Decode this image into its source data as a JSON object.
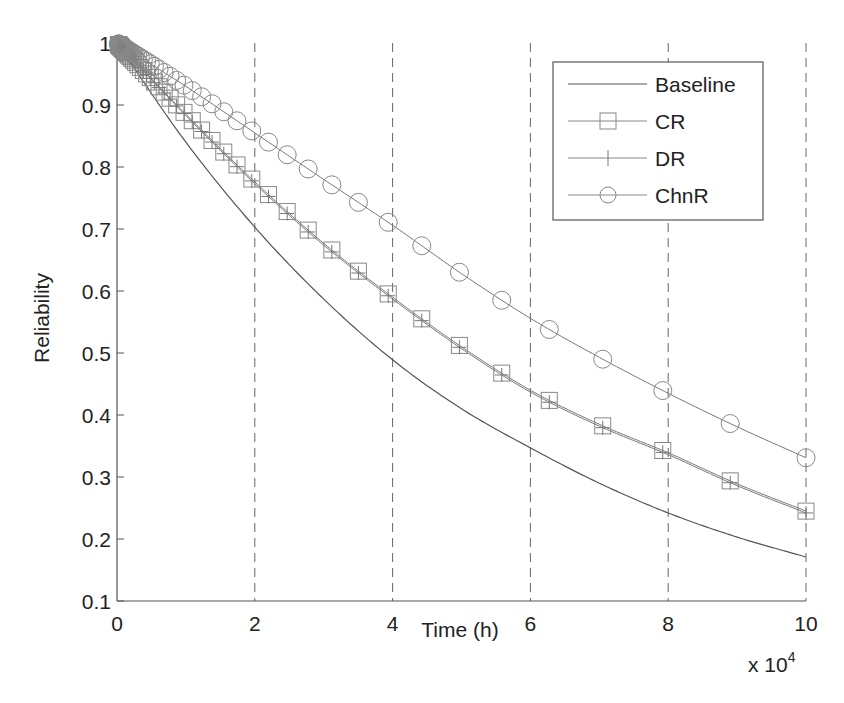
{
  "chart_data": {
    "type": "line",
    "title": "",
    "xlabel": "Time (h)",
    "ylabel": "Reliability",
    "x_multiplier_label": "x 10",
    "x_multiplier_exponent": "4",
    "xlim": [
      0,
      10
    ],
    "ylim": [
      0.1,
      1
    ],
    "xticks": [
      0,
      2,
      4,
      6,
      8,
      10
    ],
    "xtick_labels": [
      "0",
      "2",
      "4",
      "6",
      "8",
      "10"
    ],
    "yticks": [
      0.1,
      0.2,
      0.3,
      0.4,
      0.5,
      0.6,
      0.7,
      0.8,
      0.9,
      1
    ],
    "ytick_labels": [
      "0.1",
      "0.2",
      "0.3",
      "0.4",
      "0.5",
      "0.6",
      "0.7",
      "0.8",
      "0.9",
      "1"
    ],
    "grid": {
      "x": true,
      "y": false,
      "style": "dashed"
    },
    "legend_position": "upper right",
    "x": [
      0,
      1,
      2,
      3,
      4,
      5,
      6,
      7,
      8,
      9,
      10
    ],
    "series": [
      {
        "name": "Baseline",
        "marker": "none",
        "values": [
          1.0,
          0.84,
          0.703,
          0.587,
          0.489,
          0.41,
          0.347,
          0.29,
          0.242,
          0.203,
          0.171
        ]
      },
      {
        "name": "CR",
        "marker": "square",
        "values": [
          1.0,
          0.885,
          0.776,
          0.677,
          0.59,
          0.51,
          0.44,
          0.385,
          0.339,
          0.289,
          0.245
        ]
      },
      {
        "name": "DR",
        "marker": "plus",
        "values": [
          1.0,
          0.883,
          0.773,
          0.674,
          0.587,
          0.507,
          0.437,
          0.382,
          0.336,
          0.286,
          0.242
        ]
      },
      {
        "name": "ChnR",
        "marker": "circle",
        "values": [
          1.0,
          0.93,
          0.855,
          0.78,
          0.706,
          0.628,
          0.556,
          0.493,
          0.435,
          0.381,
          0.331
        ]
      }
    ]
  },
  "legend": {
    "items": [
      "Baseline",
      "CR",
      "DR",
      "ChnR"
    ]
  },
  "colors": {
    "axis": "#555555",
    "line": "#777777",
    "baseline": "#555555",
    "grid": "#666666",
    "text": "#222222"
  }
}
